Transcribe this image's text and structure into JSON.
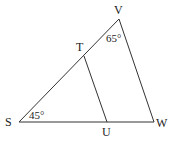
{
  "diagram": {
    "points": {
      "S": {
        "label": "S",
        "x": 19,
        "y": 122
      },
      "V": {
        "label": "V",
        "x": 119,
        "y": 19
      },
      "W": {
        "label": "W",
        "x": 154,
        "y": 122
      },
      "T": {
        "label": "T",
        "x": 84,
        "y": 56
      },
      "U": {
        "label": "U",
        "x": 107,
        "y": 122
      }
    },
    "segments": [
      [
        "S",
        "V"
      ],
      [
        "V",
        "W"
      ],
      [
        "S",
        "W"
      ],
      [
        "T",
        "U"
      ]
    ],
    "angles": {
      "S": {
        "label": "45°"
      },
      "V": {
        "label": "65°"
      }
    }
  }
}
